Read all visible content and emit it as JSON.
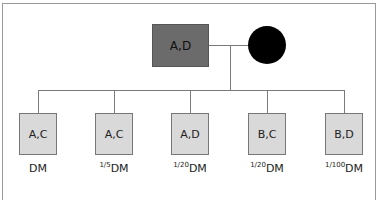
{
  "parents": {
    "father": {
      "genotype": "A,D",
      "shape": "square",
      "fill": "#6b6b6b"
    },
    "mother": {
      "genotype": "",
      "shape": "circle",
      "fill": "#000000"
    }
  },
  "children": [
    {
      "genotype": "A,C",
      "frac": "",
      "label": "DM"
    },
    {
      "genotype": "A,C",
      "frac": "1/5",
      "label": "DM"
    },
    {
      "genotype": "A,D",
      "frac": "1/20",
      "label": "DM"
    },
    {
      "genotype": "B,C",
      "frac": "1/20",
      "label": "DM"
    },
    {
      "genotype": "B,D",
      "frac": "1/100",
      "label": "DM"
    }
  ]
}
